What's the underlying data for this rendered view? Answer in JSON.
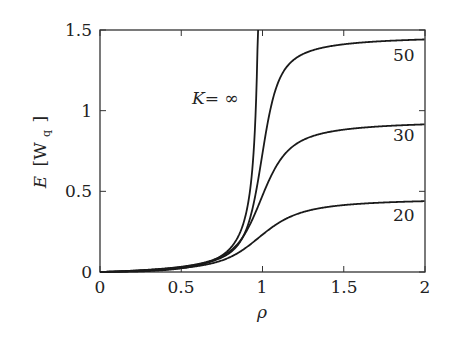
{
  "chart_data": {
    "type": "line",
    "title": "",
    "xlabel": "ρ",
    "ylabel": "E [Wq]",
    "xlim": [
      0,
      2
    ],
    "ylim": [
      0,
      1.5
    ],
    "grid": false,
    "legend": "inline annotations",
    "x_ticks": [
      "0",
      "0.5",
      "1",
      "1.5",
      "2"
    ],
    "y_ticks": [
      "0",
      "0.5",
      "1",
      "1.5"
    ],
    "x": [
      0,
      0.5,
      0.6,
      0.7,
      0.75,
      0.8,
      0.85,
      0.9,
      0.95,
      1.0,
      1.1,
      1.2,
      1.3,
      1.4,
      1.5,
      1.6,
      1.7,
      1.8,
      1.9,
      2.0
    ],
    "series": [
      {
        "name": "K = ∞",
        "label": "K= ∞",
        "values": [
          0,
          0.0,
          0.005,
          0.03,
          0.06,
          0.12,
          0.25,
          0.55,
          1.1,
          null,
          null,
          null,
          null,
          null,
          null,
          null,
          null,
          null,
          null,
          null
        ]
      },
      {
        "name": "K = 50",
        "label": "50",
        "values": [
          0,
          0.0,
          0.005,
          0.03,
          0.06,
          0.11,
          0.22,
          0.42,
          0.68,
          0.92,
          1.18,
          1.31,
          1.37,
          1.41,
          1.43,
          1.44,
          1.445,
          1.45,
          1.452,
          1.455
        ]
      },
      {
        "name": "K = 30",
        "label": "30",
        "values": [
          0,
          0.0,
          0.005,
          0.03,
          0.055,
          0.1,
          0.18,
          0.3,
          0.44,
          0.57,
          0.74,
          0.83,
          0.88,
          0.91,
          0.925,
          0.935,
          0.94,
          0.945,
          0.948,
          0.95
        ]
      },
      {
        "name": "K = 20",
        "label": "20",
        "values": [
          0,
          0.0,
          0.004,
          0.02,
          0.04,
          0.065,
          0.1,
          0.14,
          0.19,
          0.24,
          0.31,
          0.36,
          0.39,
          0.41,
          0.425,
          0.435,
          0.443,
          0.448,
          0.452,
          0.455
        ]
      }
    ]
  },
  "labels": {
    "k_inf": "K= ∞",
    "k50": "50",
    "k30": "30",
    "k20": "20",
    "xlabel": "ρ",
    "ylabel_E": "E",
    "ylabel_W": "[W",
    "ylabel_q": "q",
    "ylabel_close": "]"
  }
}
